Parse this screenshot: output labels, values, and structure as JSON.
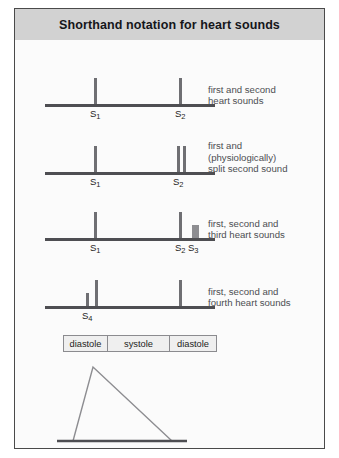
{
  "figure": {
    "title": "Shorthand notation for heart sounds",
    "border_color": "#4a4a4a",
    "header_band_color": "#d2d2d2",
    "background_color": "#fbfbfb"
  },
  "trace_color": "#6f6f73",
  "baseline_color": "#4e4e52",
  "block_color": "#8d8d91",
  "rows": [
    {
      "id": "first-and-second",
      "caption": "first and second\nheart sounds",
      "marks": [
        {
          "label": "S",
          "sub": "1",
          "x": 79,
          "height": 26,
          "kind": "thin",
          "labelled": true
        },
        {
          "label": "S",
          "sub": "2",
          "x": 164,
          "height": 26,
          "kind": "thin",
          "labelled": true
        }
      ]
    },
    {
      "id": "split-second",
      "caption": "first and\n(physiologically)\nsplit second sound",
      "marks": [
        {
          "label": "S",
          "sub": "1",
          "x": 79,
          "height": 26,
          "kind": "thin",
          "labelled": true
        },
        {
          "label": "S",
          "sub": "2",
          "x": 162,
          "height": 26,
          "kind": "thin",
          "labelled": true
        },
        {
          "label": "",
          "sub": "",
          "x": 168,
          "height": 26,
          "kind": "thin",
          "labelled": false
        }
      ]
    },
    {
      "id": "third-heart-sound",
      "caption": "first, second and\nthird heart sounds",
      "marks": [
        {
          "label": "S",
          "sub": "1",
          "x": 79,
          "height": 26,
          "kind": "thin",
          "labelled": true
        },
        {
          "label": "S",
          "sub": "2",
          "x": 164,
          "height": 26,
          "kind": "thin",
          "labelled": true
        },
        {
          "label": "S",
          "sub": "3",
          "x": 177,
          "height": 13,
          "kind": "block",
          "labelled": true
        }
      ]
    },
    {
      "id": "fourth-heart-sound",
      "caption": "first, second and\nfourth heart sounds",
      "marks": [
        {
          "label": "S",
          "sub": "4",
          "x": 71,
          "height": 13,
          "kind": "thin",
          "labelled": true
        },
        {
          "label": "",
          "sub": "",
          "x": 80,
          "height": 26,
          "kind": "thin",
          "labelled": false
        },
        {
          "label": "",
          "sub": "",
          "x": 164,
          "height": 26,
          "kind": "thin",
          "labelled": false
        }
      ]
    }
  ],
  "phase_bar": {
    "cells": [
      {
        "label": "diastole",
        "width": 44
      },
      {
        "label": "systole",
        "width": 62
      },
      {
        "label": "diastole",
        "width": 46
      }
    ]
  },
  "pressure_curve": {
    "baseline_y": 92,
    "points": "58,92 78,18 157,92",
    "baseline": "42,92 172,92",
    "stroke": "#8d8d91",
    "baseline_stroke": "#4e4e52"
  }
}
